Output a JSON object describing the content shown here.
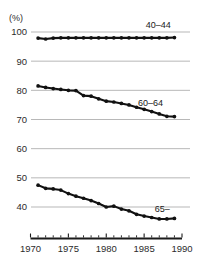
{
  "chart_data": {
    "type": "line",
    "title": "",
    "subtitle": "",
    "xlabel": "",
    "ylabel": "(%)",
    "unit_label": "(%)",
    "xlim": [
      1970,
      1990
    ],
    "ylim": [
      35,
      103
    ],
    "yticks": [
      40,
      50,
      60,
      70,
      80,
      90,
      100
    ],
    "ytick_labels": [
      "40",
      "50",
      "60",
      "70",
      "80",
      "90",
      "100"
    ],
    "xticks": [
      1970,
      1975,
      1980,
      1985,
      1990
    ],
    "xtick_labels": [
      "1970",
      "1975",
      "1980",
      "1985",
      "1990"
    ],
    "xticks_minor": [
      1971,
      1972,
      1973,
      1974,
      1976,
      1977,
      1978,
      1979,
      1981,
      1982,
      1983,
      1984,
      1986,
      1987,
      1988,
      1989
    ],
    "grid": "horizontal",
    "legend_position": "inline-right",
    "x": [
      1971,
      1972,
      1973,
      1974,
      1975,
      1976,
      1977,
      1978,
      1979,
      1980,
      1981,
      1982,
      1983,
      1984,
      1985,
      1986,
      1987,
      1988,
      1989
    ],
    "series": [
      {
        "name": "40–44",
        "label": "40–44",
        "label_x": 1985.2,
        "label_y": 101.5,
        "color": "#111111",
        "values": [
          97.9,
          97.6,
          97.9,
          98.0,
          98.0,
          98.0,
          98.0,
          98.0,
          98.0,
          98.0,
          98.0,
          98.0,
          98.0,
          98.0,
          98.0,
          98.0,
          98.0,
          98.0,
          98.1
        ]
      },
      {
        "name": "60–64",
        "label": "60–64",
        "label_x": 1984.2,
        "label_y": 74.5,
        "color": "#111111",
        "values": [
          81.5,
          81.0,
          80.6,
          80.3,
          80.0,
          79.9,
          78.2,
          78.0,
          77.1,
          76.3,
          76.0,
          75.5,
          75.0,
          74.2,
          73.5,
          72.7,
          71.9,
          71.1,
          71.0
        ]
      },
      {
        "name": "65–",
        "label": "65–",
        "label_x": 1986.4,
        "label_y": 38.4,
        "color": "#111111",
        "values": [
          47.5,
          46.4,
          46.2,
          45.8,
          44.6,
          43.7,
          43.0,
          42.2,
          41.2,
          40.0,
          40.3,
          39.3,
          38.7,
          37.5,
          36.9,
          36.4,
          35.9,
          35.9,
          36.1
        ]
      }
    ]
  },
  "figure": {
    "background_color": "#ffffff",
    "axis_color": "#1a1a1a",
    "grid_color": "#9a9a9a",
    "line_color": "#111111"
  }
}
